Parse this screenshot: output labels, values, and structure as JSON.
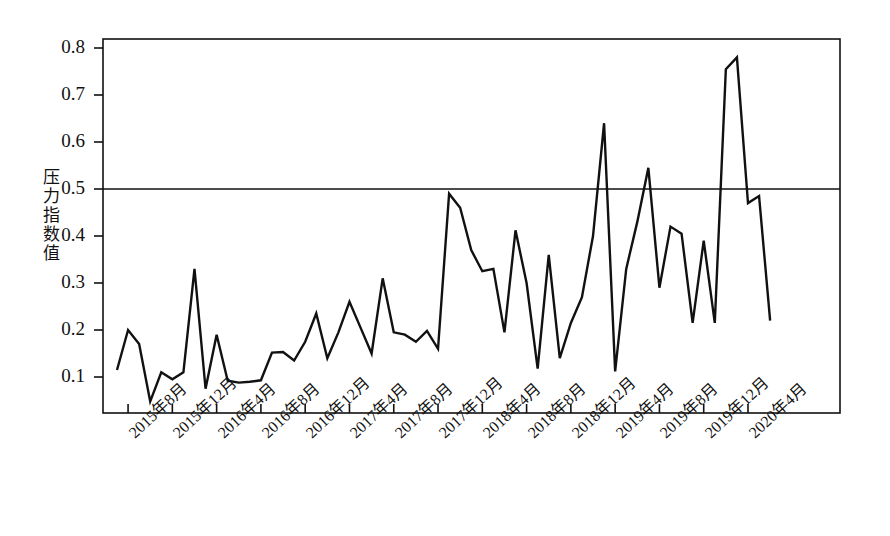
{
  "chart_data": {
    "type": "line",
    "title": "",
    "xlabel": "",
    "ylabel": "压力指数值",
    "ylim": [
      0.0,
      0.82
    ],
    "yticks": [
      0.1,
      0.2,
      0.3,
      0.4,
      0.5,
      0.6,
      0.7,
      0.8
    ],
    "ytick_labels": [
      "0.1",
      "0.2",
      "0.3",
      "0.4",
      "0.5",
      "0.6",
      "0.7",
      "0.8"
    ],
    "grid": false,
    "reference_line": 0.5,
    "legend": null,
    "xtick_labels": [
      "2015年8月",
      "2015年12月",
      "2016年4月",
      "2016年8月",
      "2016年12月",
      "2017年4月",
      "2017年8月",
      "2017年12月",
      "2018年4月",
      "2018年8月",
      "2018年12月",
      "2019年4月",
      "2019年8月",
      "2019年12月",
      "2020年4月"
    ],
    "x": [
      "2015年7月",
      "2015年8月",
      "2015年9月",
      "2015年10月",
      "2015年11月",
      "2015年12月",
      "2016年1月",
      "2016年2月",
      "2016年3月",
      "2016年4月",
      "2016年5月",
      "2016年6月",
      "2016年7月",
      "2016年8月",
      "2016年9月",
      "2016年10月",
      "2016年11月",
      "2016年12月",
      "2017年1月",
      "2017年2月",
      "2017年3月",
      "2017年4月",
      "2017年5月",
      "2017年6月",
      "2017年7月",
      "2017年8月",
      "2017年9月",
      "2017年10月",
      "2017年11月",
      "2017年12月",
      "2018年1月",
      "2018年2月",
      "2018年3月",
      "2018年4月",
      "2018年5月",
      "2018年6月",
      "2018年7月",
      "2018年8月",
      "2018年9月",
      "2018年10月",
      "2018年11月",
      "2018年12月",
      "2019年1月",
      "2019年2月",
      "2019年3月",
      "2019年4月",
      "2019年5月",
      "2019年6月",
      "2019年7月",
      "2019年8月",
      "2019年9月",
      "2019年10月",
      "2019年11月",
      "2019年12月",
      "2020年1月",
      "2020年2月",
      "2020年3月",
      "2020年4月",
      "2020年5月",
      "2020年6月"
    ],
    "values": [
      0.115,
      0.2,
      0.17,
      0.048,
      0.11,
      0.095,
      0.11,
      0.33,
      0.075,
      0.19,
      0.092,
      0.088,
      0.09,
      0.093,
      0.152,
      0.153,
      0.135,
      0.175,
      0.235,
      0.14,
      0.195,
      0.26,
      0.205,
      0.15,
      0.31,
      0.195,
      0.19,
      0.175,
      0.198,
      0.16,
      0.49,
      0.46,
      0.37,
      0.325,
      0.33,
      0.195,
      0.412,
      0.3,
      0.118,
      0.36,
      0.14,
      0.215,
      0.27,
      0.4,
      0.64,
      0.112,
      0.33,
      0.43,
      0.545,
      0.29,
      0.42,
      0.405,
      0.215,
      0.39,
      0.215,
      0.755,
      0.78,
      0.47,
      0.485,
      0.22
    ]
  }
}
